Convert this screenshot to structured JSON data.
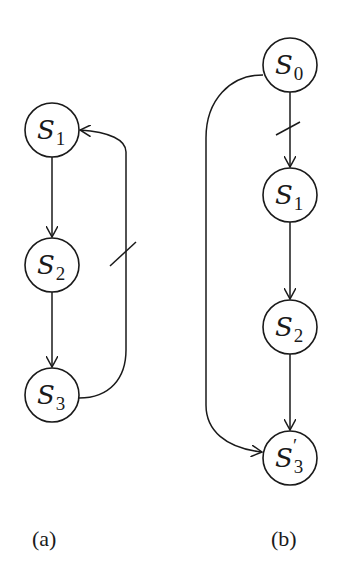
{
  "diagram": {
    "panels": [
      {
        "caption": "(a)",
        "nodes": [
          {
            "id": "S1",
            "base": "S",
            "sub": "1",
            "prime": ""
          },
          {
            "id": "S2",
            "base": "S",
            "sub": "2",
            "prime": ""
          },
          {
            "id": "S3",
            "base": "S",
            "sub": "3",
            "prime": ""
          }
        ],
        "edges": [
          {
            "from": "S1",
            "to": "S2",
            "blocked": false
          },
          {
            "from": "S2",
            "to": "S3",
            "blocked": false
          },
          {
            "from": "S3",
            "to": "S1",
            "blocked": true
          }
        ]
      },
      {
        "caption": "(b)",
        "nodes": [
          {
            "id": "S0",
            "base": "S",
            "sub": "0",
            "prime": ""
          },
          {
            "id": "S1",
            "base": "S",
            "sub": "1",
            "prime": ""
          },
          {
            "id": "S2",
            "base": "S",
            "sub": "2",
            "prime": ""
          },
          {
            "id": "S3'",
            "base": "S",
            "sub": "3",
            "prime": "′"
          }
        ],
        "edges": [
          {
            "from": "S0",
            "to": "S1",
            "blocked": true
          },
          {
            "from": "S1",
            "to": "S2",
            "blocked": false
          },
          {
            "from": "S2",
            "to": "S3'",
            "blocked": false
          },
          {
            "from": "S0",
            "to": "S3'",
            "blocked": false
          }
        ]
      }
    ],
    "colors": {
      "stroke": "#1a1a1a",
      "background": "#ffffff"
    }
  }
}
